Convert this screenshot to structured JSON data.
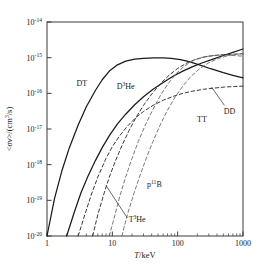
{
  "figure": {
    "name": "fusion-reactivity-chart",
    "background": "#ffffff",
    "frame_color": "#3a3a3a"
  },
  "chart_data": {
    "type": "line",
    "title": "",
    "xlabel": "T/keV",
    "xlabel_parts": {
      "italic": "T",
      "rest": "/keV"
    },
    "ylabel": "<σv>/(cm³/s)",
    "ylabel_parts": {
      "lt": "<",
      "sigma": "σ",
      "v": "v",
      "gt": ">/(cm",
      "sup": "3",
      "tail": "/s)"
    },
    "xscale": "log",
    "yscale": "log",
    "xlim": [
      1,
      1000
    ],
    "ylim": [
      1e-20,
      1e-14
    ],
    "grid": false,
    "legend": "inline-labels",
    "xticks": [
      1,
      10,
      100,
      1000
    ],
    "xtick_labels": [
      "1",
      "10",
      "100",
      "1000"
    ],
    "xminor_ticks": [
      2,
      3,
      4,
      5,
      6,
      7,
      8,
      9,
      20,
      30,
      40,
      50,
      60,
      70,
      80,
      90,
      200,
      300,
      400,
      500,
      600,
      700,
      800,
      900
    ],
    "yticks": [
      1e-14,
      1e-15,
      1e-16,
      1e-17,
      1e-18,
      1e-19,
      1e-20
    ],
    "ytick_mantissa": "10",
    "ytick_exponents": [
      "-14",
      "-15",
      "-16",
      "-17",
      "-18",
      "-19",
      "-20"
    ],
    "series": [
      {
        "name": "DT",
        "label": "DT",
        "style": "solid",
        "color": "#1a1a1a",
        "width": 1.25,
        "label_pos": {
          "x_keV": 3.4,
          "y": 1.6e-16
        },
        "points": [
          [
            1.0,
            1e-20
          ],
          [
            1.3,
            1.1e-19
          ],
          [
            1.7,
            7e-19
          ],
          [
            2.2,
            3e-18
          ],
          [
            3.0,
            1.3e-17
          ],
          [
            4.0,
            4.2e-17
          ],
          [
            5.5,
            1.2e-16
          ],
          [
            7.0,
            2.4e-16
          ],
          [
            9.0,
            4.2e-16
          ],
          [
            12.0,
            6.3e-16
          ],
          [
            16.0,
            8e-16
          ],
          [
            22.0,
            9.1e-16
          ],
          [
            30.0,
            9.6e-16
          ],
          [
            42.0,
            9.8e-16
          ],
          [
            60.0,
            9.9e-16
          ],
          [
            80.0,
            9.6e-16
          ],
          [
            110.0,
            8.8e-16
          ],
          [
            150.0,
            7.7e-16
          ],
          [
            220.0,
            6.2e-16
          ],
          [
            320.0,
            4.9e-16
          ],
          [
            500.0,
            3.8e-16
          ],
          [
            700.0,
            3.2e-16
          ],
          [
            1000.0,
            2.7e-16
          ]
        ]
      },
      {
        "name": "DD",
        "label": "DD",
        "style": "solid",
        "color": "#1a1a1a",
        "width": 1.25,
        "label_pos": {
          "x_keV": 620,
          "y": 2.6e-17
        },
        "leader": {
          "from_x_keV": 520,
          "from_y": 4.6e-17,
          "to_x_keV": 330,
          "to_y": 1.5e-16
        },
        "points": [
          [
            2.0,
            1e-20
          ],
          [
            2.6,
            4.5e-20
          ],
          [
            3.3,
            1.6e-19
          ],
          [
            4.2,
            4.6e-19
          ],
          [
            5.5,
            1.3e-18
          ],
          [
            7.0,
            3e-18
          ],
          [
            9.0,
            6.5e-18
          ],
          [
            12.0,
            1.4e-17
          ],
          [
            16.0,
            2.6e-17
          ],
          [
            22.0,
            4.8e-17
          ],
          [
            30.0,
            8e-17
          ],
          [
            42.0,
            1.3e-16
          ],
          [
            60.0,
            2e-16
          ],
          [
            85.0,
            3e-16
          ],
          [
            120.0,
            4.2e-16
          ],
          [
            170.0,
            5.6e-16
          ],
          [
            240.0,
            7.2e-16
          ],
          [
            340.0,
            9e-16
          ],
          [
            500.0,
            1.15e-15
          ],
          [
            700.0,
            1.4e-15
          ],
          [
            1000.0,
            1.75e-15
          ]
        ]
      },
      {
        "name": "D3He",
        "label": "D³He",
        "label_base": "D",
        "label_sup": "3",
        "label_tail": "He",
        "style": "dashed",
        "color": "#3a3a3a",
        "width": 1.0,
        "label_pos": {
          "x_keV": 16,
          "y": 1.3e-16
        },
        "points": [
          [
            5.0,
            1e-20
          ],
          [
            6.0,
            4e-20
          ],
          [
            7.5,
            1.6e-19
          ],
          [
            9.0,
            4.5e-19
          ],
          [
            11.0,
            1.2e-18
          ],
          [
            14.0,
            3.4e-18
          ],
          [
            18.0,
            9e-18
          ],
          [
            23.0,
            2.1e-17
          ],
          [
            30.0,
            4.6e-17
          ],
          [
            40.0,
            9.5e-17
          ],
          [
            55.0,
            1.9e-16
          ],
          [
            75.0,
            3.3e-16
          ],
          [
            100.0,
            5e-16
          ],
          [
            140.0,
            7.2e-16
          ],
          [
            190.0,
            9e-16
          ],
          [
            260.0,
            1.05e-15
          ],
          [
            360.0,
            1.15e-15
          ],
          [
            500.0,
            1.22e-15
          ],
          [
            700.0,
            1.25e-15
          ],
          [
            1000.0,
            1.28e-15
          ]
        ]
      },
      {
        "name": "TT",
        "label": "TT",
        "style": "dashed",
        "color": "#3a3a3a",
        "width": 1.0,
        "label_pos": {
          "x_keV": 235,
          "y": 1.6e-17
        },
        "points": [
          [
            3.0,
            1e-20
          ],
          [
            3.8,
            4e-20
          ],
          [
            4.8,
            1.5e-19
          ],
          [
            6.0,
            4.5e-19
          ],
          [
            8.0,
            1.5e-18
          ],
          [
            10.0,
            3.2e-18
          ],
          [
            13.0,
            6.5e-18
          ],
          [
            17.0,
            1.2e-17
          ],
          [
            23.0,
            2.1e-17
          ],
          [
            30.0,
            3.1e-17
          ],
          [
            42.0,
            4.6e-17
          ],
          [
            60.0,
            6.4e-17
          ],
          [
            85.0,
            8.2e-17
          ],
          [
            120.0,
            1e-16
          ],
          [
            170.0,
            1.15e-16
          ],
          [
            250.0,
            1.3e-16
          ],
          [
            360.0,
            1.4e-16
          ],
          [
            520.0,
            1.5e-16
          ],
          [
            740.0,
            1.55e-16
          ],
          [
            1000.0,
            1.6e-16
          ]
        ]
      },
      {
        "name": "p11B",
        "label": "p¹¹B",
        "label_base": "p",
        "label_sup": "11",
        "label_tail": "B",
        "style": "dashed",
        "color": "#6a6a6a",
        "width": 0.9,
        "label_pos": {
          "x_keV": 44,
          "y": 2.4e-19
        },
        "points": [
          [
            9.0,
            1e-20
          ],
          [
            11.0,
            4e-20
          ],
          [
            13.0,
            1.3e-19
          ],
          [
            16.0,
            4.5e-19
          ],
          [
            20.0,
            1.5e-18
          ],
          [
            25.0,
            4.5e-18
          ],
          [
            32.0,
            1.3e-17
          ],
          [
            42.0,
            3.6e-17
          ],
          [
            55.0,
            9e-17
          ],
          [
            72.0,
            1.9e-16
          ],
          [
            95.0,
            3.6e-16
          ],
          [
            130.0,
            6e-16
          ],
          [
            180.0,
            8.6e-16
          ],
          [
            250.0,
            1.05e-15
          ],
          [
            350.0,
            1.15e-15
          ],
          [
            500.0,
            1.18e-15
          ],
          [
            700.0,
            1.15e-15
          ],
          [
            1000.0,
            1.1e-15
          ]
        ]
      },
      {
        "name": "T3He",
        "label": "T³He",
        "label_base": "T",
        "label_sup": "3",
        "label_tail": "He",
        "style": "dashed",
        "color": "#6a6a6a",
        "width": 0.9,
        "label_pos": {
          "x_keV": 24,
          "y": 2.4e-20
        },
        "leader": {
          "from_x_keV": 17,
          "from_y": 3.2e-20,
          "to_x_keV": 8.0,
          "to_y": 2.6e-19
        },
        "points": [
          [
            14.0,
            1e-20
          ],
          [
            17.0,
            4e-20
          ],
          [
            21.0,
            1.4e-19
          ],
          [
            26.0,
            4.5e-19
          ],
          [
            33.0,
            1.5e-18
          ],
          [
            42.0,
            4.5e-18
          ],
          [
            54.0,
            1.3e-17
          ],
          [
            70.0,
            3.4e-17
          ],
          [
            92.0,
            8e-17
          ],
          [
            120.0,
            1.6e-16
          ],
          [
            160.0,
            3e-16
          ],
          [
            220.0,
            5e-16
          ],
          [
            300.0,
            7.2e-16
          ],
          [
            420.0,
            9.5e-16
          ],
          [
            600.0,
            1.15e-15
          ],
          [
            800.0,
            1.25e-15
          ],
          [
            1000.0,
            1.32e-15
          ]
        ]
      }
    ]
  }
}
